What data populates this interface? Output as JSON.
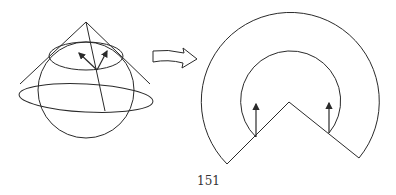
{
  "page": {
    "page_number": "151"
  },
  "figure": {
    "left_panel": {
      "description": "Cone tangent to sphere along a circle of latitude, with two tangent vectors at a point on the circle",
      "elements": [
        "sphere",
        "cone",
        "cone-base-ellipse",
        "tangent-circle",
        "generator-line",
        "tangent-vector-1",
        "tangent-vector-2"
      ]
    },
    "transition_arrow": "hollow-right-arrow-icon",
    "right_panel": {
      "description": "Cone unrolled into a flat annular sector with parallel-transported vectors at both ends of the inner arc",
      "elements": [
        "outer-arc",
        "inner-arc",
        "sector-edge-left",
        "sector-edge-right",
        "vector-left",
        "vector-right"
      ]
    },
    "colors": {
      "stroke": "#2a2a2a",
      "background": "#ffffff"
    }
  }
}
